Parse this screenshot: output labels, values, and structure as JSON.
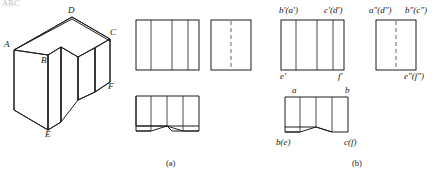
{
  "figure": {
    "corner_note": "ABC",
    "captions": [
      {
        "id": "caption-a",
        "text": "(a)",
        "x": 166,
        "y": 160
      },
      {
        "id": "caption-b",
        "text": "(b)",
        "x": 352,
        "y": 160
      }
    ]
  },
  "isometric": {
    "name": "isometric-pictorial-view",
    "vertex_labels": [
      {
        "key": "A",
        "text": "A",
        "x": 4,
        "y": 44
      },
      {
        "key": "B",
        "text": "B",
        "x": 41,
        "y": 60
      },
      {
        "key": "C",
        "text": "C",
        "x": 106,
        "y": 33
      },
      {
        "key": "D",
        "text": "D",
        "x": 66,
        "y": 10
      },
      {
        "key": "E",
        "text": "E",
        "x": 47,
        "y": 128
      },
      {
        "key": "F",
        "text": "F",
        "x": 103,
        "y": 88
      }
    ]
  },
  "views_a": {
    "name": "orthographic-views-unlabeled",
    "front_view": {
      "name": "front-view-a",
      "internal_lines": 3,
      "hidden_lines": 0
    },
    "side_view": {
      "name": "side-view-a",
      "internal_lines": 0,
      "hidden_lines": 1
    },
    "top_view": {
      "name": "top-view-a",
      "notch": "vee"
    }
  },
  "views_b": {
    "name": "orthographic-views-labeled",
    "front_view": {
      "name": "front-view-b",
      "labels": [
        {
          "key": "b-prime-a-prime",
          "text": "b′(a′)",
          "x": 279,
          "y": 7,
          "align": "left"
        },
        {
          "key": "c-prime-d-prime",
          "text": "c′(d′)",
          "x": 332,
          "y": 7,
          "align": "left"
        },
        {
          "key": "e-prime",
          "text": "e′",
          "x": 278,
          "y": 72,
          "align": "left"
        },
        {
          "key": "f-prime",
          "text": "f′",
          "x": 340,
          "y": 72,
          "align": "left"
        }
      ]
    },
    "side_view": {
      "name": "side-view-b",
      "labels": [
        {
          "key": "a-dprime-d-dprime",
          "text": "a″(d″)",
          "x": 371,
          "y": 7,
          "align": "left"
        },
        {
          "key": "b-dprime-c-dprime",
          "text": "b″(c″)",
          "x": 408,
          "y": 7,
          "align": "left"
        },
        {
          "key": "e-dprime-f-dprime",
          "text": "e″(f″)",
          "x": 406,
          "y": 72,
          "align": "left"
        }
      ]
    },
    "top_view": {
      "name": "top-view-b",
      "labels": [
        {
          "key": "a",
          "text": "a",
          "x": 290,
          "y": 88,
          "align": "left"
        },
        {
          "key": "b",
          "text": "b",
          "x": 347,
          "y": 88,
          "align": "left"
        },
        {
          "key": "b-e",
          "text": "b(e)",
          "x": 276,
          "y": 140,
          "align": "left"
        },
        {
          "key": "c-f",
          "text": "c(f)",
          "x": 345,
          "y": 140,
          "align": "left"
        }
      ]
    }
  }
}
